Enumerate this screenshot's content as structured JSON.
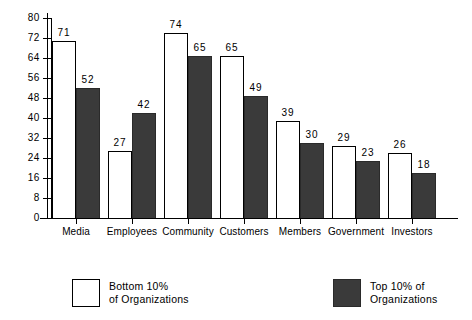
{
  "chart_data": {
    "type": "bar",
    "title": "",
    "subtitle": "",
    "xlabel": "",
    "ylabel": "",
    "ylim": [
      0,
      80
    ],
    "yticks": [
      0,
      8,
      16,
      24,
      32,
      40,
      48,
      56,
      64,
      72,
      80
    ],
    "grid": false,
    "legend_position": "bottom",
    "categories": [
      "Media",
      "Employees",
      "Community",
      "Customers",
      "Members",
      "Government",
      "Investors"
    ],
    "series": [
      {
        "name": "Bottom 10% of Organizations",
        "style": "light",
        "color": "#ffffff",
        "values": [
          71,
          27,
          74,
          65,
          39,
          29,
          26
        ]
      },
      {
        "name": "Top 10% of Organizations",
        "style": "dark",
        "color": "#3a3a3a",
        "values": [
          52,
          42,
          65,
          49,
          30,
          23,
          18
        ]
      }
    ]
  },
  "legend": {
    "items": [
      {
        "name": "bottom-10-percent",
        "line1": "Bottom  10%",
        "line2": "of  Organizations",
        "style": "light"
      },
      {
        "name": "top-10-percent",
        "line1": "Top 10% of",
        "line2": "Organizations",
        "style": "dark"
      }
    ]
  },
  "colors": {
    "axis": "#000000",
    "light_bar_fill": "#ffffff",
    "light_bar_stroke": "#000000",
    "dark_bar_fill": "#3a3a3a",
    "background": "#ffffff"
  }
}
